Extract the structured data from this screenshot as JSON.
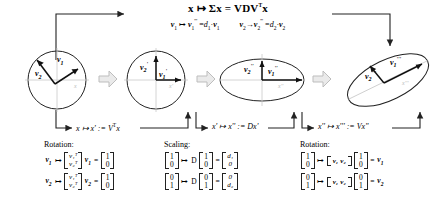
{
  "figure": {
    "title_formula": "x ↦ Σx = VDVᵀx",
    "subformula_left": "v₁ ↦ v₁''' = d₁·v₁",
    "subformula_right": "v₂ ↦ v₂''' = d₂·v₂"
  },
  "top": {
    "main": {
      "x": "x",
      "maps": "↦",
      "sigma_x": "Σx",
      "eq": "=",
      "rhs": "VDV",
      "rhs_sup": "T",
      "rhs_tail": "x"
    },
    "sub_left": {
      "v": "v",
      "i": "1",
      "maps": "↦",
      "v2": "v",
      "prime": "'''",
      "eq": "=",
      "d": "d",
      "di": "1",
      "dot": "·",
      "v3": "v",
      "i3": "1"
    },
    "sub_right": {
      "v": "v",
      "i": "2",
      "maps": "→",
      "v2": "v",
      "prime": "'''",
      "eq": "=",
      "d": "d",
      "di": "2",
      "dot": "·",
      "v3": "v",
      "i3": "2"
    }
  },
  "panels": [
    {
      "id": "panel-circle-original",
      "shape": "circle",
      "labels": [
        {
          "name": "v1",
          "text": "v",
          "sub": "1",
          "prime": ""
        },
        {
          "name": "v2",
          "text": "v",
          "sub": "2",
          "prime": ""
        }
      ],
      "axis_label": "x"
    },
    {
      "id": "panel-circle-rotated",
      "shape": "circle",
      "labels": [
        {
          "name": "v1p",
          "text": "v",
          "sub": "1",
          "prime": "'"
        },
        {
          "name": "v2p",
          "text": "v",
          "sub": "2",
          "prime": "'"
        }
      ],
      "axis_label": "x'"
    },
    {
      "id": "panel-ellipse-scaled",
      "shape": "ellipse",
      "labels": [
        {
          "name": "v1pp",
          "text": "v",
          "sub": "1",
          "prime": "''"
        },
        {
          "name": "v2pp",
          "text": "v",
          "sub": "2",
          "prime": "''"
        }
      ],
      "axis_label": "x''"
    },
    {
      "id": "panel-ellipse-rotated",
      "shape": "ellipse-tilted",
      "labels": [
        {
          "name": "v1ppp",
          "text": "v",
          "sub": "1",
          "prime": "'''"
        },
        {
          "name": "v2ppp",
          "text": "v",
          "sub": "2",
          "prime": "'''"
        }
      ],
      "axis_label": "x'''"
    }
  ],
  "transforms": [
    {
      "id": "transform-rotation-vt",
      "text": "x ↦ x' := V",
      "sup": "T",
      "tail": "x"
    },
    {
      "id": "transform-scaling-d",
      "text": "x' ↦ x'' := Dx'",
      "sup": "",
      "tail": ""
    },
    {
      "id": "transform-rotation-v",
      "text": "x'' ↦ x''' := Vx''",
      "sup": "",
      "tail": ""
    }
  ],
  "boxes": [
    {
      "id": "box-rotation-left",
      "title": "Rotation:",
      "rows": [
        {
          "lhs_v": "v",
          "lhs_sub": "1",
          "matrix_rows": [
            "v₁ᵀ",
            "v₂ᵀ"
          ],
          "mid_v": "v",
          "mid_sub": "1",
          "eq": "=",
          "result": [
            "1",
            "0"
          ]
        },
        {
          "lhs_v": "v",
          "lhs_sub": "2",
          "matrix_rows": [
            "v₁ᵀ",
            "v₂ᵀ"
          ],
          "mid_v": "v",
          "mid_sub": "2",
          "eq": "=",
          "result": [
            "1",
            "0"
          ]
        }
      ]
    },
    {
      "id": "box-scaling",
      "title": "Scaling:",
      "rows": [
        {
          "input": [
            "1",
            "0"
          ],
          "op": "D",
          "vec": [
            "1",
            "0"
          ],
          "eq": "=",
          "result": [
            "d₁",
            "0"
          ]
        },
        {
          "input": [
            "0",
            "1"
          ],
          "op": "D",
          "vec": [
            "0",
            "1"
          ],
          "eq": "=",
          "result": [
            "0",
            "d₂"
          ]
        }
      ]
    },
    {
      "id": "box-rotation-right",
      "title": "Rotation:",
      "rows": [
        {
          "input": [
            "1",
            "0"
          ],
          "matrix": [
            "v₁",
            "v₂"
          ],
          "vec": [
            "1",
            "0"
          ],
          "eq": "=",
          "result_v": "v",
          "result_sub": "1"
        },
        {
          "input": [
            "0",
            "1"
          ],
          "matrix": [
            "v₁",
            "v₂"
          ],
          "vec": [
            "0",
            "1"
          ],
          "eq": "=",
          "result_v": "v",
          "result_sub": "2"
        }
      ]
    }
  ],
  "colors": {
    "stroke": "#222222",
    "text": "#000000",
    "arrow_fill": "#e9e9e9",
    "arrow_stroke": "#b5b5b5",
    "background": "#ffffff"
  }
}
